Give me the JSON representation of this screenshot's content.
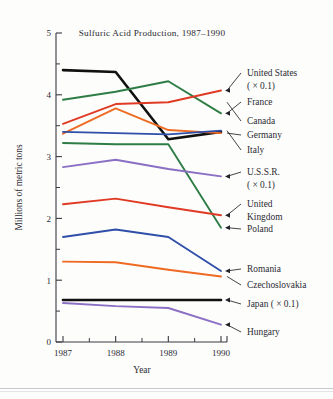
{
  "chart_data": {
    "type": "line",
    "title": "Sulfuric Acid Production, 1987–1990",
    "xlabel": "Year",
    "ylabel": "Millions of metric tons",
    "x": [
      1987,
      1988,
      1989,
      1990
    ],
    "xtick_labels": [
      "1987",
      "1988",
      "1989",
      "1990"
    ],
    "ytick_labels": [
      "0",
      "1",
      "2",
      "3",
      "4",
      "5"
    ],
    "yticks": [
      0,
      1,
      2,
      3,
      4,
      5
    ],
    "yminor": [
      0.5,
      1.5,
      2.5,
      3.5,
      4.5
    ],
    "ylim": [
      0,
      5
    ],
    "xlim": [
      1986.7,
      1990.3
    ],
    "grid": false,
    "legend_position": "right-annotations",
    "series": [
      {
        "name": "United States",
        "suffix": "( × 0.1)",
        "color": "#111111",
        "values": [
          4.4,
          4.37,
          3.28,
          3.4
        ]
      },
      {
        "name": "France",
        "suffix": "",
        "color": "#2e7d46",
        "values": [
          3.92,
          4.05,
          4.22,
          3.7
        ]
      },
      {
        "name": "Canada",
        "suffix": "",
        "color": "#e03a24",
        "values": [
          3.53,
          3.85,
          3.88,
          4.07
        ]
      },
      {
        "name": "Germany",
        "suffix": "",
        "color": "#ef6a22",
        "values": [
          3.37,
          3.78,
          3.43,
          3.38
        ]
      },
      {
        "name": "Italy",
        "suffix": "",
        "color": "#2f4fa8",
        "values": [
          3.4,
          3.38,
          3.36,
          3.42
        ]
      },
      {
        "name": "Poland",
        "suffix": "",
        "color": "#2e7d46",
        "values": [
          3.22,
          3.2,
          3.2,
          1.85
        ]
      },
      {
        "name": "U.S.S.R.",
        "suffix": "( × 0.1)",
        "color": "#8a6fc4",
        "values": [
          2.83,
          2.95,
          2.8,
          2.68
        ]
      },
      {
        "name": "United Kingdom",
        "suffix": "",
        "color": "#e03a24",
        "values": [
          2.23,
          2.32,
          2.18,
          2.05
        ]
      },
      {
        "name": "Romania",
        "suffix": "",
        "color": "#2f4fa8",
        "values": [
          1.7,
          1.82,
          1.7,
          1.15
        ]
      },
      {
        "name": "Czechoslovakia",
        "suffix": "",
        "color": "#ef6a22",
        "values": [
          1.3,
          1.29,
          1.17,
          1.06
        ]
      },
      {
        "name": "Japan",
        "suffix": "( × 0.1)",
        "color": "#111111",
        "values": [
          0.68,
          0.68,
          0.68,
          0.68
        ]
      },
      {
        "name": "Hungary",
        "suffix": "",
        "color": "#8a6fc4",
        "values": [
          0.63,
          0.58,
          0.55,
          0.28
        ]
      }
    ],
    "annotations": [
      {
        "id": "united-states",
        "lines": [
          "United States",
          "( × 0.1)"
        ],
        "anchor_value": 4.07,
        "text_x": 247,
        "text_y": 76,
        "leader": "arrow"
      },
      {
        "id": "france",
        "lines": [
          "France"
        ],
        "anchor_value": 3.7,
        "text_x": 247,
        "text_y": 105,
        "leader": "arrow"
      },
      {
        "id": "canada",
        "lines": [
          "Canada"
        ],
        "anchor_value": 3.88,
        "text_x": 247,
        "text_y": 124,
        "leader": "line"
      },
      {
        "id": "germany",
        "lines": [
          "Germany"
        ],
        "anchor_value": 3.38,
        "text_x": 247,
        "text_y": 138,
        "leader": "line"
      },
      {
        "id": "italy",
        "lines": [
          "Italy"
        ],
        "anchor_value": 3.42,
        "text_x": 247,
        "text_y": 153,
        "leader": "line"
      },
      {
        "id": "ussr",
        "lines": [
          "U.S.S.R.",
          "( × 0.1)"
        ],
        "anchor_value": 2.68,
        "text_x": 247,
        "text_y": 175,
        "leader": "arrow"
      },
      {
        "id": "united-kingdom",
        "lines": [
          "United",
          "Kingdom"
        ],
        "anchor_value": 2.05,
        "text_x": 247,
        "text_y": 207,
        "leader": "arrow"
      },
      {
        "id": "poland",
        "lines": [
          "Poland"
        ],
        "anchor_value": 1.85,
        "text_x": 247,
        "text_y": 232,
        "leader": "arrow"
      },
      {
        "id": "romania",
        "lines": [
          "Romania"
        ],
        "anchor_value": 1.15,
        "text_x": 247,
        "text_y": 272,
        "leader": "arrow"
      },
      {
        "id": "czechoslovakia",
        "lines": [
          "Czechoslovakia"
        ],
        "anchor_value": 1.06,
        "text_x": 247,
        "text_y": 288,
        "leader": "line"
      },
      {
        "id": "japan",
        "lines": [
          "Japan ( × 0.1)"
        ],
        "anchor_value": 0.68,
        "text_x": 247,
        "text_y": 307,
        "leader": "arrow"
      },
      {
        "id": "hungary",
        "lines": [
          "Hungary"
        ],
        "anchor_value": 0.28,
        "text_x": 247,
        "text_y": 335,
        "leader": "arrow"
      }
    ]
  }
}
